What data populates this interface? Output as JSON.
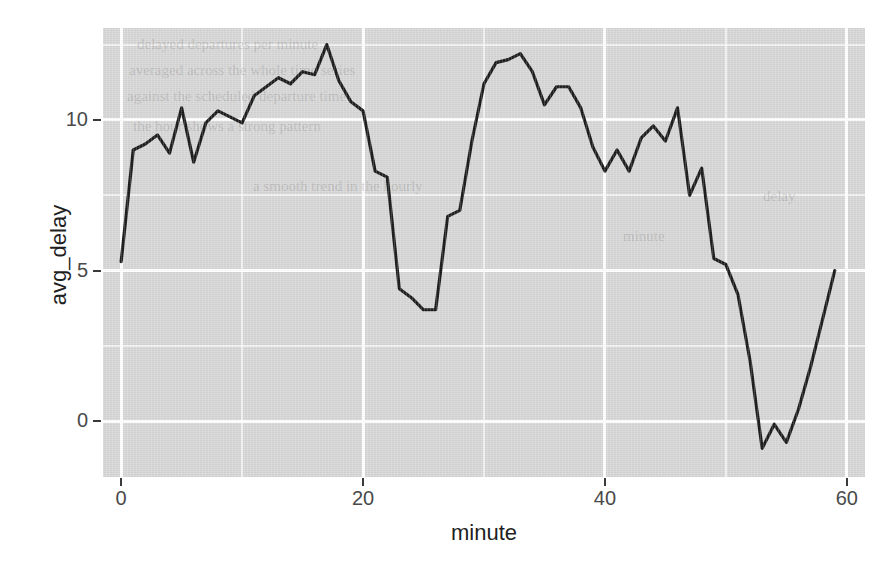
{
  "chart_data": {
    "type": "line",
    "title": "",
    "subtitle": "",
    "xlabel": "minute",
    "ylabel": "avg_delay",
    "xlim": [
      -1.5,
      61.5
    ],
    "ylim": [
      -1.85,
      13.05
    ],
    "xticks": [
      0,
      20,
      40,
      60
    ],
    "xtick_labels": [
      "0",
      "20",
      "40",
      "60"
    ],
    "yticks": [
      0,
      5,
      10
    ],
    "ytick_labels": [
      "0",
      "5",
      "10"
    ],
    "x_minor_gridlines": [
      10,
      30,
      50
    ],
    "y_minor_gridlines": [
      2.5,
      7.5,
      12.5
    ],
    "grid": true,
    "legend": "none",
    "panel_background": "#d6d6d6",
    "gridline_color": "#ffffff",
    "line_color": "#1a1a1a",
    "series": [
      {
        "name": "avg_delay",
        "x": [
          0,
          1,
          2,
          3,
          4,
          5,
          6,
          7,
          8,
          9,
          10,
          11,
          12,
          13,
          14,
          15,
          16,
          17,
          18,
          19,
          20,
          21,
          22,
          23,
          24,
          25,
          26,
          27,
          28,
          29,
          30,
          31,
          32,
          33,
          34,
          35,
          36,
          37,
          38,
          39,
          40,
          41,
          42,
          43,
          44,
          45,
          46,
          47,
          48,
          49,
          50,
          51,
          52,
          53,
          54,
          55,
          56,
          57,
          58,
          59
        ],
        "values": [
          5.3,
          9.0,
          9.2,
          9.5,
          8.9,
          10.4,
          8.6,
          9.9,
          10.3,
          10.1,
          9.9,
          10.8,
          11.1,
          11.4,
          11.2,
          11.6,
          11.5,
          12.5,
          11.3,
          10.6,
          10.3,
          8.3,
          8.1,
          4.4,
          4.1,
          3.7,
          3.7,
          6.8,
          7.0,
          9.3,
          11.2,
          11.9,
          12.0,
          12.2,
          11.6,
          10.5,
          11.1,
          11.1,
          10.4,
          9.1,
          8.3,
          9.0,
          8.3,
          9.4,
          9.8,
          9.3,
          10.4,
          7.5,
          8.4,
          5.4,
          5.2,
          4.2,
          2.0,
          -0.9,
          -0.1,
          -0.7,
          0.4,
          1.8,
          3.4,
          5.0
        ]
      }
    ]
  },
  "axes": {
    "x_title": "minute",
    "y_title": "avg_delay"
  },
  "ghost_text": [
    {
      "text": "delayed departures per minute",
      "x": 34,
      "y": 8
    },
    {
      "text": "averaged across the whole time series",
      "x": 26,
      "y": 34
    },
    {
      "text": "against the scheduled departure time",
      "x": 24,
      "y": 60
    },
    {
      "text": "the hour shows a strong pattern",
      "x": 30,
      "y": 90
    },
    {
      "text": "a smooth trend in the hourly",
      "x": 150,
      "y": 150
    },
    {
      "text": "minute",
      "x": 520,
      "y": 200
    },
    {
      "text": "delay",
      "x": 660,
      "y": 160
    }
  ]
}
